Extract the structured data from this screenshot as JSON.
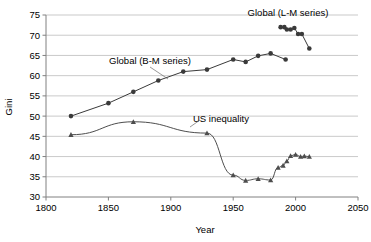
{
  "chart_data": {
    "type": "line",
    "title": "",
    "xlabel": "Year",
    "ylabel": "Gini",
    "xlim": [
      1800,
      2050
    ],
    "ylim": [
      30,
      75
    ],
    "xticks": [
      1800,
      1850,
      1900,
      1950,
      2000,
      2050
    ],
    "yticks": [
      30,
      35,
      40,
      45,
      50,
      55,
      60,
      65,
      70,
      75
    ],
    "grid": true,
    "grid_axis": "y",
    "legend_position": "inline-annotations",
    "series": [
      {
        "name": "Global (B-M series)",
        "marker": "circle",
        "color": "#3a3a3a",
        "x": [
          1820,
          1850,
          1870,
          1890,
          1910,
          1929,
          1950,
          1960,
          1970,
          1980,
          1992
        ],
        "values": [
          50.0,
          53.2,
          56.0,
          58.8,
          61.0,
          61.5,
          64.0,
          63.4,
          64.9,
          65.5,
          64.0
        ]
      },
      {
        "name": "Global (L-M series)",
        "marker": "circle",
        "color": "#3a3a3a",
        "x": [
          1988,
          1991,
          1993,
          1996,
          1999,
          2002,
          2005,
          2011
        ],
        "values": [
          72.0,
          72.0,
          71.4,
          71.4,
          71.8,
          70.3,
          70.3,
          66.7
        ]
      },
      {
        "name": "US inequality",
        "marker": "triangle",
        "color": "#4d4d4d",
        "x": [
          1820,
          1870,
          1929,
          1950,
          1960,
          1970,
          1980,
          1986,
          1990,
          1993,
          1996,
          2000,
          2004,
          2007,
          2011
        ],
        "values": [
          45.4,
          48.6,
          45.8,
          35.4,
          34.1,
          34.5,
          34.2,
          37.3,
          37.8,
          38.9,
          40.2,
          40.5,
          40.0,
          40.1,
          40.0
        ]
      }
    ],
    "annotations": [
      {
        "text": "Global (L-M series)",
        "x_px": 288,
        "y_px": 16
      },
      {
        "text": "Global (B-M series)",
        "x_px": 150,
        "y_px": 64
      },
      {
        "text": "US inequality",
        "x_px": 221,
        "y_px": 122
      }
    ]
  },
  "axis": {
    "y_title": "Gini",
    "x_title": "Year",
    "x_tick_labels": [
      "1800",
      "1850",
      "1900",
      "1950",
      "2000",
      "2050"
    ],
    "y_tick_labels": [
      "30",
      "35",
      "40",
      "45",
      "50",
      "55",
      "60",
      "65",
      "70",
      "75"
    ]
  },
  "labels": {
    "lm_series": "Global (L-M series)",
    "bm_series": "Global (B-M series)",
    "us_series": "US inequality"
  },
  "colors": {
    "axis": "#808080",
    "grid": "#b3b3b3",
    "bm_line": "#3a3a3a",
    "lm_line": "#3a3a3a",
    "us_line": "#6b6b6b",
    "background": "#ffffff"
  }
}
